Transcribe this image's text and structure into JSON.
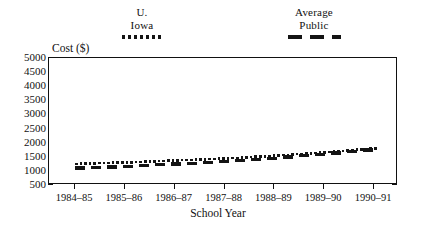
{
  "legend": {
    "entries": [
      {
        "name": "u-iowa",
        "line1": "U.",
        "line2": "Iowa",
        "style": "dotted",
        "color": "#141414"
      },
      {
        "name": "average-public",
        "line1": "Average",
        "line2": "Public",
        "style": "dashed",
        "color": "#141414"
      }
    ]
  },
  "axes": {
    "y_title": "Cost ($)",
    "x_title": "School Year",
    "y_ticks": [
      "5000",
      "4500",
      "4000",
      "3500",
      "3000",
      "2500",
      "2000",
      "1500",
      "1000",
      "500"
    ],
    "x_ticks": [
      "1984–85",
      "1985–86",
      "1986–87",
      "1987–88",
      "1988–89",
      "1989–90",
      "1990–91"
    ]
  },
  "chart_data": {
    "type": "line",
    "title": "",
    "subtitle": "",
    "xlabel": "School Year",
    "ylabel": "Cost ($)",
    "categories": [
      "1984–85",
      "1985–86",
      "1986–87",
      "1987–88",
      "1988–89",
      "1989–90",
      "1990–91"
    ],
    "ylim": [
      500,
      5000
    ],
    "ytick_step": 500,
    "grid": false,
    "legend_position": "above-plot",
    "series": [
      {
        "name": "U. Iowa",
        "linestyle": "dotted",
        "color": "#141414",
        "values": [
          1250,
          1300,
          1370,
          1440,
          1540,
          1660,
          1800
        ]
      },
      {
        "name": "Average Public",
        "linestyle": "dashed",
        "color": "#141414",
        "values": [
          1100,
          1160,
          1240,
          1330,
          1450,
          1600,
          1760
        ]
      }
    ]
  }
}
